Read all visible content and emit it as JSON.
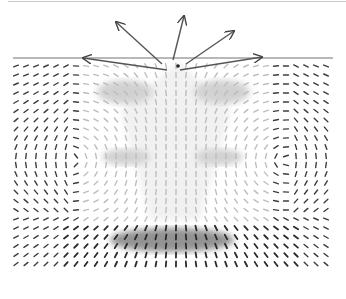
{
  "figure": {
    "type": "vector-field",
    "surface_line": {
      "y": 58,
      "x_start": 13,
      "x_end": 333,
      "color": "#a0a0a0"
    },
    "source_point": {
      "x": 178,
      "y": 66
    },
    "large_arrows": [
      {
        "name": "up-left",
        "from": [
          162,
          64
        ],
        "to": [
          116,
          22
        ]
      },
      {
        "name": "up",
        "from": [
          173,
          60
        ],
        "to": [
          184,
          16
        ]
      },
      {
        "name": "up-right",
        "from": [
          186,
          64
        ],
        "to": [
          234,
          31
        ]
      },
      {
        "name": "left",
        "from": [
          167,
          70
        ],
        "to": [
          83,
          58
        ]
      },
      {
        "name": "right",
        "from": [
          180,
          70
        ],
        "to": [
          262,
          57
        ]
      }
    ],
    "shaded_regions": [
      {
        "name": "upper-left-lobe",
        "cx": 125,
        "cy": 92,
        "rx": 28,
        "ry": 12
      },
      {
        "name": "upper-right-lobe",
        "cx": 222,
        "cy": 92,
        "rx": 28,
        "ry": 12
      },
      {
        "name": "mid-left-blob",
        "cx": 126,
        "cy": 157,
        "rx": 24,
        "ry": 8
      },
      {
        "name": "mid-right-blob",
        "cx": 219,
        "cy": 157,
        "rx": 24,
        "ry": 8
      },
      {
        "name": "bottom-dark-band",
        "cx": 172,
        "cy": 240,
        "rx": 62,
        "ry": 12
      }
    ],
    "colors": {
      "arrow_dark": "#2a2a2a",
      "arrow_light": "#bdbdbd",
      "shade": "#9a9a9a",
      "background": "#ffffff"
    }
  }
}
